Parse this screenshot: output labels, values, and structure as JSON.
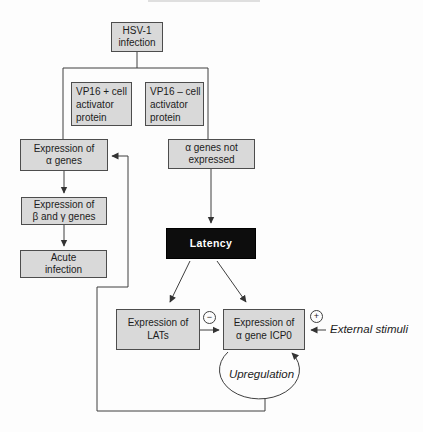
{
  "figure": {
    "background": "#fdfdfd",
    "box_fill": "#d9d9d9",
    "box_border": "#4d4d4d",
    "latency_fill": "#0d0d0d",
    "latency_text_color": "#ffffff",
    "line_color": "#3f3f3f"
  },
  "nodes": {
    "hsv1": "HSV-1\ninfection",
    "vp16_plus": "VP16 + cell\nactivator\nprotein",
    "vp16_minus": "VP16 – cell\nactivator\nprotein",
    "alpha_expressed": "Expression of\nα genes",
    "alpha_not_expressed": "α genes not\nexpressed",
    "beta_gamma": "Expression of\nβ and γ genes",
    "acute": "Acute\ninfection",
    "latency": "Latency",
    "lats": "Expression of\nLATs",
    "icp0": "Expression of\nα gene ICP0"
  },
  "annotations": {
    "upregulation": "Upregulation",
    "external_stimuli": "External stimuli",
    "negative_symbol": "−",
    "positive_symbol": "+"
  }
}
